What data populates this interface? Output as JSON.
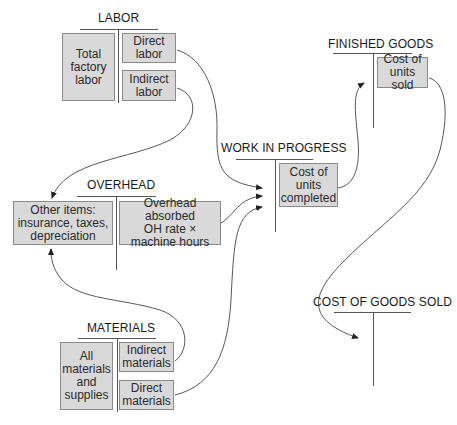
{
  "accounts": {
    "labor": {
      "title": "LABOR",
      "debit": "Total\nfactory\nlabor",
      "credits": [
        "Direct\nlabor",
        "Indirect\nlabor"
      ]
    },
    "overhead": {
      "title": "OVERHEAD",
      "debit": "Other items:\ninsurance, taxes,\ndepreciation",
      "credit": "Overhead absorbed\nOH rate ×\nmachine hours"
    },
    "materials": {
      "title": "MATERIALS",
      "debit": "All\nmaterials\nand\nsupplies",
      "credits": [
        "Indirect\nmaterials",
        "Direct\nmaterials"
      ]
    },
    "work_in_progress": {
      "title": "WORK IN PROGRESS",
      "credit": "Cost of\nunits\ncompleted"
    },
    "finished_goods": {
      "title": "FINISHED GOODS",
      "credit": "Cost of\nunits sold"
    },
    "cost_of_goods_sold": {
      "title": "COST OF GOODS SOLD"
    }
  },
  "flows": [
    {
      "from": "Direct labor",
      "to": "WORK IN PROGRESS"
    },
    {
      "from": "Indirect labor",
      "to": "Other items (OVERHEAD)"
    },
    {
      "from": "Indirect materials",
      "to": "Other items (OVERHEAD)"
    },
    {
      "from": "Overhead absorbed",
      "to": "WORK IN PROGRESS"
    },
    {
      "from": "Direct materials",
      "to": "WORK IN PROGRESS"
    },
    {
      "from": "Cost of units completed",
      "to": "FINISHED GOODS"
    },
    {
      "from": "Cost of units sold",
      "to": "COST OF GOODS SOLD"
    }
  ],
  "colors": {
    "box_fill": "#d9d9d9",
    "box_border": "#8a8a8a",
    "line": "#555555"
  }
}
